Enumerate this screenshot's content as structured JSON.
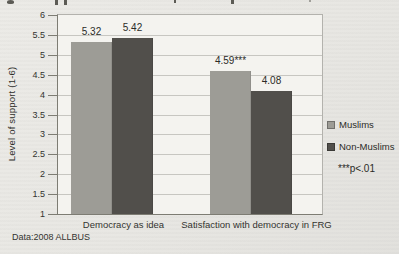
{
  "page": {
    "source_note": "Data:2008 ALLBUS"
  },
  "chart_data": {
    "type": "bar",
    "title": "",
    "ylabel": "Level of support (1-6)",
    "xlabel": "",
    "ylim": [
      1,
      6
    ],
    "ytick_step": 0.5,
    "ytick_labels": [
      "6",
      "5.5",
      "5",
      "4.5",
      "4",
      "3.5",
      "3",
      "2.5",
      "2",
      "1.5",
      "1"
    ],
    "grid": true,
    "legend_position": "right",
    "categories": [
      "Democracy as idea",
      "Satisfaction with democracy in FRG"
    ],
    "series": [
      {
        "name": "Muslims",
        "color": "#9d9c96",
        "values": [
          5.32,
          4.59
        ],
        "value_labels": [
          "5.32",
          "4.59***"
        ]
      },
      {
        "name": "Non-Muslims",
        "color": "#514f4b",
        "values": [
          5.42,
          4.08
        ],
        "value_labels": [
          "5.42",
          "4.08"
        ]
      }
    ],
    "annotation": "***p<.01"
  }
}
